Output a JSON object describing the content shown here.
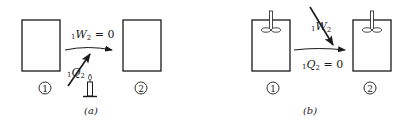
{
  "panels": [
    {
      "id": "a",
      "caption": "(a)",
      "state1_label": "1",
      "state2_label": "2",
      "work_label": {
        "prefix": "1",
        "symbol": "W",
        "sub": "2",
        "suffix": " = 0"
      },
      "heat_label": {
        "prefix": "1",
        "symbol": "Q",
        "sub": "2",
        "suffix": ""
      },
      "heat_source": "candle-icon",
      "stirrer": false
    },
    {
      "id": "b",
      "caption": "(b)",
      "state1_label": "1",
      "state2_label": "2",
      "work_label": {
        "prefix": "1",
        "symbol": "W",
        "sub": "2",
        "suffix": ""
      },
      "heat_label": {
        "prefix": "1",
        "symbol": "Q",
        "sub": "2",
        "suffix": " = 0"
      },
      "heat_source": null,
      "stirrer": true
    }
  ]
}
